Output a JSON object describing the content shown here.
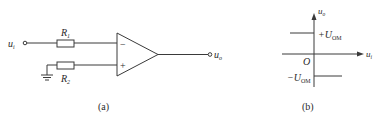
{
  "figure_a": {
    "caption": "(a)",
    "input_label": "u",
    "input_sub": "i",
    "output_label": "u",
    "output_sub": "o",
    "r1_label": "R",
    "r1_sub": "1",
    "r2_label": "R",
    "r2_sub": "2",
    "minus_sign": "−",
    "plus_sign": "+"
  },
  "figure_b": {
    "caption": "(b)",
    "y_axis_label": "u",
    "y_axis_sub": "o",
    "x_axis_label": "u",
    "x_axis_sub": "i",
    "origin_label": "O",
    "pos_level_prefix": "+U",
    "pos_level_sub": "OM",
    "neg_level_prefix": "−U",
    "neg_level_sub": "OM"
  },
  "colors": {
    "stroke": "#3a3a3a",
    "background": "#ffffff"
  }
}
